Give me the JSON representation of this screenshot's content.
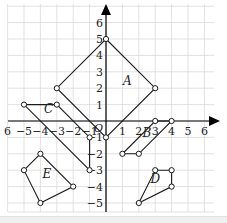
{
  "diagram": {
    "type": "coordinate-grid",
    "x_range": [
      -6,
      6
    ],
    "y_range": [
      -5,
      6
    ],
    "x_tick_labels": [
      "6",
      "-5",
      "-4",
      "-3",
      "-2",
      "-1",
      "1",
      "2",
      "3",
      "4",
      "5",
      "6"
    ],
    "x_tick_values": [
      -6,
      -5,
      -4,
      -3,
      -2,
      -1,
      1,
      2,
      3,
      4,
      5,
      6
    ],
    "y_tick_labels": [
      "6",
      "5",
      "4",
      "3",
      "2",
      "1",
      "-1",
      "-2",
      "-3",
      "-4",
      "-5"
    ],
    "y_tick_values": [
      6,
      5,
      4,
      3,
      2,
      1,
      -1,
      -2,
      -3,
      -4,
      -5
    ],
    "origin_label": "O",
    "colors": {
      "grid": "#d9d9d9",
      "axis": "#000000",
      "shape": "#1a1a1a"
    },
    "shapes": [
      {
        "label": "A",
        "label_pos": [
          1.3,
          2.2
        ],
        "vertices": [
          [
            0,
            5
          ],
          [
            3,
            2
          ],
          [
            0,
            -1
          ],
          [
            -3,
            2
          ]
        ]
      },
      {
        "label": "B",
        "label_pos": [
          2.5,
          -1.0
        ],
        "vertices": [
          [
            1,
            -2
          ],
          [
            2,
            -2
          ],
          [
            4,
            0
          ],
          [
            3,
            0
          ]
        ]
      },
      {
        "label": "C",
        "label_pos": [
          -3.5,
          0.5
        ],
        "vertices": [
          [
            -5,
            1
          ],
          [
            -3,
            1
          ],
          [
            -1,
            -1
          ],
          [
            -1,
            -3
          ]
        ]
      },
      {
        "label": "D",
        "label_pos": [
          3.0,
          -3.8
        ],
        "vertices": [
          [
            2,
            -5
          ],
          [
            3,
            -3
          ],
          [
            4,
            -3
          ],
          [
            4,
            -4
          ]
        ]
      },
      {
        "label": "E",
        "label_pos": [
          -3.6,
          -3.5
        ],
        "vertices": [
          [
            -4,
            -2
          ],
          [
            -5,
            -3
          ],
          [
            -4,
            -5
          ],
          [
            -2,
            -4
          ]
        ]
      }
    ]
  }
}
